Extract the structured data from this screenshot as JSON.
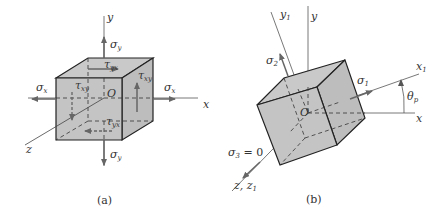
{
  "figure": {
    "panel_a": {
      "caption": "(a)",
      "axes": {
        "x": "x",
        "y": "y",
        "z": "z",
        "origin": "O"
      },
      "stresses": {
        "sigma_x_left": "σ",
        "sigma_x_left_sub": "x",
        "sigma_x_right": "σ",
        "sigma_x_right_sub": "x",
        "sigma_y_top": "σ",
        "sigma_y_top_sub": "y",
        "sigma_y_bottom": "σ",
        "sigma_y_bottom_sub": "y",
        "tau_xy_left": "τ",
        "tau_xy_left_sub": "xy",
        "tau_xy_right": "τ",
        "tau_xy_right_sub": "xy",
        "tau_yx_top": "τ",
        "tau_yx_top_sub": "yx",
        "tau_yx_bottom": "τ",
        "tau_yx_bottom_sub": "yx"
      }
    },
    "panel_b": {
      "caption": "(b)",
      "axes": {
        "x": "x",
        "y": "y",
        "x1": "x",
        "x1_sub": "1",
        "y1": "y",
        "y1_sub": "1",
        "z": "z, z",
        "z_sub": "1",
        "origin": "O"
      },
      "stresses": {
        "sigma_1": "σ",
        "sigma_1_sub": "1",
        "sigma_2": "σ",
        "sigma_2_sub": "2",
        "sigma_3": "σ",
        "sigma_3_sub": "3",
        "sigma_3_value": " = 0"
      },
      "angle": {
        "symbol": "θ",
        "sub": "p"
      }
    },
    "colors": {
      "face": "#c4c4c4",
      "edge": "#222222",
      "axis": "#555555",
      "arrow": "#666666"
    }
  }
}
